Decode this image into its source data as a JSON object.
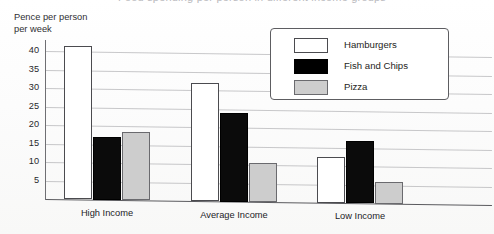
{
  "figure": {
    "clipped_title": "Food spending per person in different income groups",
    "axis_caption": "Pence per person\nper week"
  },
  "legend": {
    "position": "top-right-inside",
    "entries": [
      {
        "label": "Hamburgers",
        "swatch": "white-outlined",
        "color": "#ffffff"
      },
      {
        "label": "Fish and Chips",
        "swatch": "black-filled",
        "color": "#000000"
      },
      {
        "label": "Pizza",
        "swatch": "gray-filled",
        "color": "#cdcdcd"
      }
    ]
  },
  "chart_data": {
    "type": "bar",
    "title": "Food spending per person in different income groups",
    "xlabel": "",
    "ylabel": "Pence per person per week",
    "categories": [
      "High Income",
      "Average Income",
      "Low Income"
    ],
    "series": [
      {
        "name": "Hamburgers",
        "color": "#ffffff",
        "values": [
          41.5,
          32,
          12.5
        ]
      },
      {
        "name": "Fish and Chips",
        "color": "#000000",
        "values": [
          17,
          24,
          17
        ]
      },
      {
        "name": "Pizza",
        "color": "#cdcdcd",
        "values": [
          18.5,
          10.5,
          6
        ]
      }
    ],
    "ylim": [
      0,
      43
    ],
    "yticks": [
      5,
      10,
      15,
      20,
      25,
      30,
      35,
      40
    ],
    "ytick_labels": [
      "5",
      "10",
      "15",
      "20",
      "25",
      "30",
      "35",
      "40"
    ],
    "grid": true,
    "legend_position": "upper right"
  }
}
